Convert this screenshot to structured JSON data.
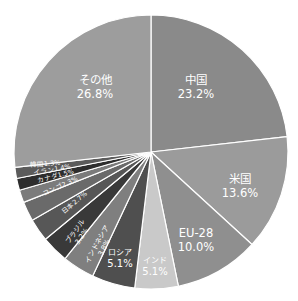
{
  "chart_data": {
    "type": "pie",
    "title": "",
    "start_angle_deg": 0,
    "direction": "clockwise",
    "center": [
      151,
      152
    ],
    "radius": 137,
    "slices": [
      {
        "label": "中国",
        "value": 23.2,
        "pct_text": "23.2%",
        "color": "#8a8a8a",
        "label_style": "big",
        "label_pos": [
          196,
          84
        ]
      },
      {
        "label": "米国",
        "value": 13.6,
        "pct_text": "13.6%",
        "color": "#9b9b9b",
        "label_style": "big",
        "label_pos": [
          240,
          183
        ]
      },
      {
        "label": "EU-28",
        "value": 10.0,
        "pct_text": "10.0%",
        "color": "#8f8f8f",
        "label_style": "big",
        "label_pos": [
          196,
          237
        ]
      },
      {
        "label": "インド",
        "value": 5.1,
        "pct_text": "5.1%",
        "color": "#c9c9c9",
        "label_style": "mid",
        "label_pos": [
          155,
          263
        ]
      },
      {
        "label": "ロシア",
        "value": 5.1,
        "pct_text": "5.1%",
        "color": "#4f4f4f",
        "label_style": "mid",
        "label_pos": [
          120,
          255
        ]
      },
      {
        "label": "インドネシア",
        "value": 3.8,
        "pct_text": "3.8%",
        "color": "#7f7f7f",
        "label_style": "rot",
        "label_pos": [
          99,
          245
        ],
        "rot": -62
      },
      {
        "label": "ブラジル",
        "value": 3.2,
        "pct_text": "3.2%",
        "color": "#393939",
        "label_style": "rot",
        "label_pos": [
          77,
          233
        ],
        "rot": -55
      },
      {
        "label": "日本",
        "value": 2.7,
        "pct_text": "2.7%",
        "color": "#575757",
        "label_style": "inline",
        "label_pos": [
          64,
          214
        ],
        "rot": -40
      },
      {
        "label": "コンゴ",
        "value": 2.3,
        "pct_text": "2.3%",
        "color": "#6a6a6a",
        "label_style": "inline",
        "label_pos": [
          44,
          196
        ],
        "rot": -25
      },
      {
        "label": "カナダ",
        "value": 1.5,
        "pct_text": "1.5%",
        "color": "#7b7b7b",
        "label_style": "inline",
        "label_pos": [
          38,
          183
        ],
        "rot": -15
      },
      {
        "label": "イラン",
        "value": 1.4,
        "pct_text": "1.4%",
        "color": "#2d2d2d",
        "label_style": "inline",
        "label_pos": [
          34,
          175
        ],
        "rot": -10
      },
      {
        "label": "韓国",
        "value": 1.3,
        "pct_text": "1.3%",
        "color": "#5b5b5b",
        "label_style": "inline",
        "label_pos": [
          30,
          167
        ],
        "rot": -4
      },
      {
        "label": "その他",
        "value": 26.8,
        "pct_text": "26.8%",
        "color": "#9d9d9d",
        "label_style": "big",
        "label_pos": [
          95,
          84
        ]
      }
    ],
    "separator_color": "#ffffff",
    "legend": "none"
  }
}
